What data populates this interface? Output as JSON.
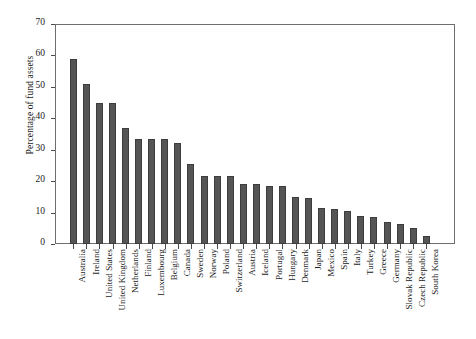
{
  "chart_data": {
    "type": "bar",
    "title": "",
    "subtitle": "",
    "xlabel": "",
    "ylabel": "Percentage of fund assets",
    "ylim": [
      0,
      70
    ],
    "yticks": [
      0,
      10,
      20,
      30,
      40,
      50,
      60,
      70
    ],
    "grid": false,
    "legend": null,
    "bar_color": "#555555",
    "bar_edge_color": "#3d3d3d",
    "frame_color": "#6e6e6e",
    "background": "#ffffff",
    "categories": [
      "Australia",
      "Ireland",
      "United States",
      "United Kingdom",
      "Netherlands",
      "Finland",
      "Luxembourg",
      "Belgium",
      "Canada",
      "Sweden",
      "Norway",
      "Poland",
      "Switzerland",
      "Austria",
      "Iceland",
      "Portugal",
      "Hungary",
      "Denmark",
      "Japan",
      "Mexico",
      "Spain",
      "Italy",
      "Turkey",
      "Greece",
      "Germany",
      "Slovak Republic",
      "Czech Republic",
      "South Korea"
    ],
    "values": [
      59.0,
      51.0,
      45.0,
      45.0,
      37.0,
      33.5,
      33.5,
      33.5,
      32.3,
      25.5,
      21.5,
      21.5,
      21.5,
      19.0,
      19.0,
      18.5,
      18.5,
      15.0,
      14.5,
      11.5,
      11.0,
      10.5,
      9.0,
      8.5,
      7.0,
      6.3,
      5.0,
      2.5
    ]
  }
}
